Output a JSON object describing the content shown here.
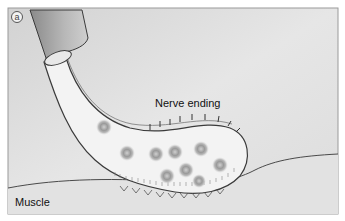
{
  "figure": {
    "panel_letter": "a",
    "labels": {
      "nerve_ending": "Nerve ending",
      "muscle": "Muscle"
    },
    "colors": {
      "background": "#dcdcdc",
      "muscle": "#d6d6d6",
      "axon_fill": "#f1f1f1",
      "sheath": "#a8a8a8",
      "outline": "#3a3a3a",
      "vesicle": "#8e8e8e"
    }
  }
}
